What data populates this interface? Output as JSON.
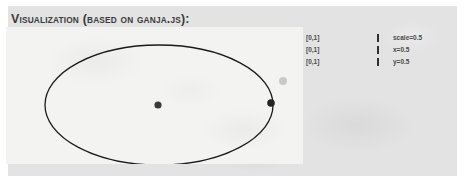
{
  "figure": {
    "title": "Visualization (based on ganja.js):",
    "panel_bg": "#e3e3e3",
    "canvas_bg": "#f3f3f1"
  },
  "canvas": {
    "name": "ganja-visualization-canvas",
    "shapes": {
      "ellipse": {
        "name": "conic-ellipse",
        "cx": 153,
        "cy": 78,
        "rx": 114,
        "ry": 60,
        "stroke": "#1a1a1a",
        "stroke_width": 1.3,
        "fill": "none"
      },
      "center_point": {
        "name": "center-point",
        "cx": 152,
        "cy": 78,
        "r": 3.6,
        "fill": "#3a3a3a"
      },
      "edge_point": {
        "name": "edge-point",
        "cx": 265,
        "cy": 76,
        "r": 3.8,
        "fill": "#242424"
      },
      "ghost_point": {
        "name": "ghost-point",
        "cx": 277,
        "cy": 54,
        "r": 4.0,
        "fill": "#c9c9c9"
      }
    }
  },
  "controls": [
    {
      "name": "scale",
      "range_label": "[0,1]",
      "value_label": "scale=0.5",
      "slider_position_pct": 50
    },
    {
      "name": "x",
      "range_label": "[0,1]",
      "value_label": "x=0.5",
      "slider_position_pct": 50
    },
    {
      "name": "y",
      "range_label": "[0,1]",
      "value_label": "y=0.5",
      "slider_position_pct": 50
    }
  ]
}
